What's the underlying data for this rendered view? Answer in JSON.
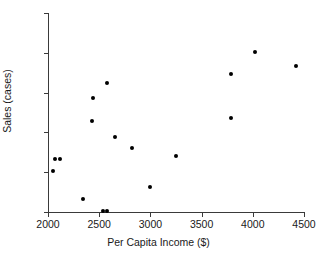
{
  "chart_data": {
    "type": "scatter",
    "title": "",
    "xlabel": "Per Capita Income ($)",
    "ylabel": "Sales (cases)",
    "xlim": [
      2000,
      4500
    ],
    "ylim": [
      50,
      300
    ],
    "xticks": [
      2000,
      2500,
      3000,
      3500,
      4000,
      4500
    ],
    "yticks": [
      50,
      100,
      150,
      200,
      250,
      300
    ],
    "xtick_labels": [
      "2000",
      "2500",
      "3000",
      "3500",
      "4000",
      "4500"
    ],
    "ytick_labels": [
      "50",
      "100",
      "150",
      "200",
      "250",
      "300"
    ],
    "grid": false,
    "legend": null,
    "marker": {
      "shape": "circle",
      "color": "#000000",
      "size": 4
    },
    "points": [
      {
        "x": 2050,
        "y": 102
      },
      {
        "x": 2070,
        "y": 117
      },
      {
        "x": 2120,
        "y": 116
      },
      {
        "x": 2340,
        "y": 66
      },
      {
        "x": 2430,
        "y": 164
      },
      {
        "x": 2440,
        "y": 193
      },
      {
        "x": 2580,
        "y": 212
      },
      {
        "x": 2540,
        "y": 51
      },
      {
        "x": 2580,
        "y": 51
      },
      {
        "x": 2650,
        "y": 144
      },
      {
        "x": 2820,
        "y": 130
      },
      {
        "x": 3000,
        "y": 81
      },
      {
        "x": 3250,
        "y": 120
      },
      {
        "x": 3790,
        "y": 168
      },
      {
        "x": 3790,
        "y": 223
      },
      {
        "x": 4020,
        "y": 251
      },
      {
        "x": 4420,
        "y": 233
      }
    ]
  },
  "axes": {
    "x_title": "Per Capita Income ($)",
    "y_title": "Sales (cases)"
  },
  "title": {
    "text": ""
  }
}
